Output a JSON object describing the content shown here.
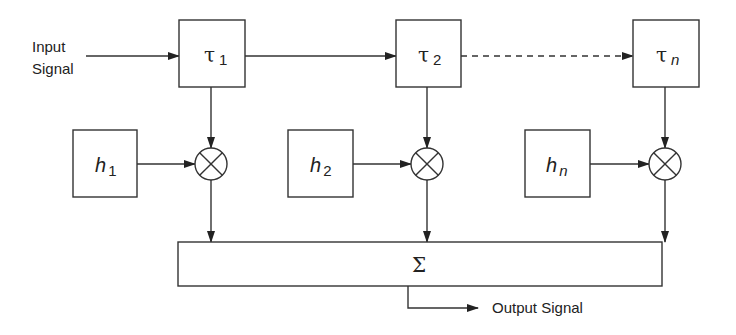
{
  "diagram": {
    "type": "tapped-delay-line block diagram",
    "input_label_line1": "Input",
    "input_label_line2": "Signal",
    "output_label": "Output Signal",
    "delays": [
      {
        "symbol": "τ",
        "subscript": "1"
      },
      {
        "symbol": "τ",
        "subscript": "2"
      },
      {
        "symbol": "τ",
        "subscript": "n"
      }
    ],
    "weights": [
      {
        "symbol": "h",
        "subscript": "1"
      },
      {
        "symbol": "h",
        "subscript": "2"
      },
      {
        "symbol": "h",
        "subscript": "n"
      }
    ],
    "multiplier_icon": "circled-times-icon",
    "summer_symbol": "Σ",
    "colors": {
      "stroke": "#333333",
      "background": "#ffffff"
    }
  }
}
